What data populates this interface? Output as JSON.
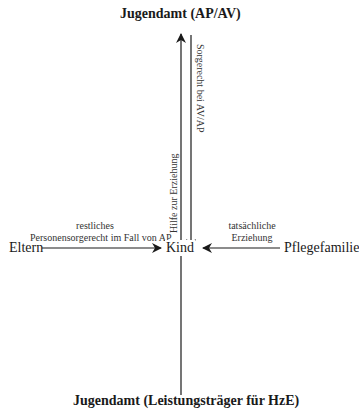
{
  "diagram": {
    "top_node": "Jugendamt (AP/AV)",
    "bottom_node": "Jugendamt (Leistungsträger für HzE)",
    "center_node": "Kind",
    "left_node": "Eltern",
    "right_node": "Pflegefamilie",
    "edges": [
      {
        "from": "Kind",
        "to": "Jugendamt (AP/AV)",
        "label": "Hilfe zur Erziehung",
        "direction": "up"
      },
      {
        "from": "Jugendamt (AP/AV)",
        "to": "Kind",
        "label": "Sorgerecht bei AV/AP",
        "direction": "down"
      },
      {
        "from": "Eltern",
        "to": "Kind",
        "label_line1": "restliches",
        "label_line2": "Personensorgerecht im Fall von AP",
        "direction": "right"
      },
      {
        "from": "Pflegefamilie",
        "to": "Kind",
        "label_line1": "tatsächliche",
        "label_line2": "Erziehung",
        "direction": "left"
      },
      {
        "from": "Jugendamt (Leistungsträger für HzE)",
        "to": "Kind",
        "label": "",
        "direction": "none"
      }
    ]
  }
}
